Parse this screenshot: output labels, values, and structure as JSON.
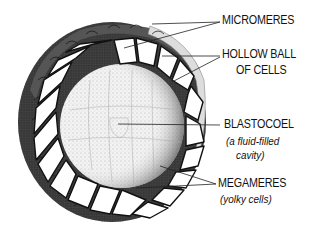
{
  "labels": {
    "micromeres": "MICROMERES",
    "hollow_ball_1": "HOLLOW BALL",
    "hollow_ball_2": "OF CELLS",
    "blastocoel": "BLASTOCOEL",
    "blastocoel_note_1": "(a fluid-filled",
    "blastocoel_note_2": "cavity)",
    "megameres": "MEGAMERES",
    "megameres_note": "(yolky cells)"
  },
  "colors": {
    "ink": "#111111",
    "background": "#ffffff",
    "stipple": "#9a9a9a"
  }
}
